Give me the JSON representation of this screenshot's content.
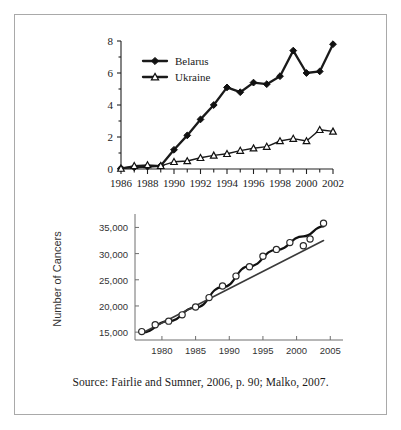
{
  "figure": {
    "source_note": "Source: Fairlie and Sumner, 2006, p. 90; Malko, 2007."
  },
  "chart_data": [
    {
      "id": "thyroid-cancer-incidence",
      "type": "line",
      "title": "",
      "subtitle": "",
      "xlabel": "",
      "ylabel": "",
      "xlim": [
        1986,
        2002
      ],
      "ylim": [
        0,
        8
      ],
      "yticks": [
        0,
        2,
        4,
        6,
        8
      ],
      "ytick_labels": [
        "0",
        "2",
        "4",
        "6",
        "8"
      ],
      "xticks": [
        1986,
        1988,
        1990,
        1992,
        1994,
        1996,
        1998,
        2000,
        2002
      ],
      "xtick_labels": [
        "1986",
        "1988",
        "1990",
        "1992",
        "1994",
        "1996",
        "1998",
        "2000",
        "2002"
      ],
      "minor_xticks_every": 1,
      "grid": false,
      "legend_position": "top-left",
      "x": [
        1986,
        1987,
        1988,
        1989,
        1990,
        1991,
        1992,
        1993,
        1994,
        1995,
        1996,
        1997,
        1998,
        1999,
        2000,
        2001,
        2002
      ],
      "series": [
        {
          "name": "Belarus",
          "marker": "filled-diamond",
          "values": [
            0.05,
            0.1,
            0.15,
            0.2,
            1.2,
            2.1,
            3.1,
            4.0,
            5.1,
            4.8,
            5.4,
            5.3,
            5.8,
            7.4,
            6.0,
            6.1,
            7.8
          ]
        },
        {
          "name": "Ukraine",
          "marker": "open-triangle",
          "values": [
            0.03,
            0.2,
            0.25,
            0.2,
            0.45,
            0.5,
            0.7,
            0.85,
            0.95,
            1.15,
            1.3,
            1.4,
            1.75,
            1.9,
            1.75,
            2.45,
            2.35
          ]
        }
      ]
    },
    {
      "id": "number-of-cancers",
      "type": "scatter",
      "title": "",
      "xlabel": "",
      "ylabel": "Number of Cancers",
      "xlim": [
        1976,
        2006
      ],
      "ylim": [
        13500,
        36800
      ],
      "yticks": [
        15000,
        20000,
        25000,
        30000,
        35000
      ],
      "ytick_labels": [
        "15,000",
        "20,000",
        "25,000",
        "30,000",
        "35,000"
      ],
      "xticks": [
        1980,
        1985,
        1990,
        1995,
        2000,
        2005
      ],
      "xtick_labels": [
        "1980",
        "1985",
        "1990",
        "1995",
        "2000",
        "2005"
      ],
      "grid": false,
      "legend_position": "none",
      "points": [
        {
          "x": 1977,
          "y": 15100
        },
        {
          "x": 1979,
          "y": 16400
        },
        {
          "x": 1981,
          "y": 17100
        },
        {
          "x": 1983,
          "y": 18300
        },
        {
          "x": 1985,
          "y": 19800
        },
        {
          "x": 1987,
          "y": 21600
        },
        {
          "x": 1989,
          "y": 23800
        },
        {
          "x": 1991,
          "y": 25700
        },
        {
          "x": 1993,
          "y": 27500
        },
        {
          "x": 1995,
          "y": 29500
        },
        {
          "x": 1997,
          "y": 30800
        },
        {
          "x": 1999,
          "y": 32100
        },
        {
          "x": 2001,
          "y": 31500
        },
        {
          "x": 2002,
          "y": 32800
        },
        {
          "x": 2004,
          "y": 35800
        }
      ],
      "fit_curve": {
        "name": "quadratic-fit",
        "x": [
          1977,
          1981,
          1985,
          1989,
          1993,
          1997,
          2001,
          2004
        ],
        "y": [
          14900,
          17100,
          19700,
          23600,
          27600,
          30700,
          33300,
          35200
        ]
      },
      "fit_line": {
        "name": "linear-trend",
        "x": [
          1977,
          2004
        ],
        "y": [
          14800,
          32500
        ]
      }
    }
  ]
}
